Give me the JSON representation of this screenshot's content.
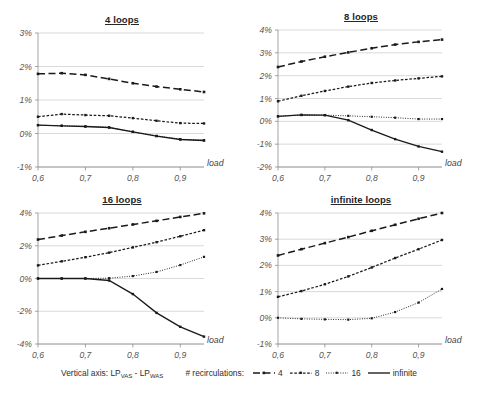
{
  "figure": {
    "width": 478,
    "height": 404,
    "background": "#ffffff",
    "ink": "#1a1a1a",
    "grid_color": "#c9c9c9"
  },
  "legend": {
    "vertical_axis_prefix": "Vertical axis: LP",
    "vertical_axis_sub1": "VAS",
    "vertical_axis_middle": " - LP",
    "vertical_axis_sub2": "WAS",
    "vertical_axis_full": "Vertical axis: LPVAS - LPWAS",
    "recirculations_caption": "# recirculations:",
    "items": [
      {
        "label": "4",
        "style": "long-dash"
      },
      {
        "label": "8",
        "style": "short-dash"
      },
      {
        "label": "16",
        "style": "dotted"
      },
      {
        "label": "infinite",
        "style": "solid"
      }
    ]
  },
  "chart_data": [
    {
      "type": "line",
      "title": "4 loops",
      "xlabel": "load",
      "ylabel": "",
      "xlim": [
        0.6,
        0.95
      ],
      "ylim": [
        -1,
        3
      ],
      "yticks": [
        3,
        2,
        1,
        0,
        -1
      ],
      "ytick_labels": [
        "3%",
        "2%",
        "1%",
        "0%",
        "-1%"
      ],
      "xticks": [
        0.6,
        0.7,
        0.8,
        0.9
      ],
      "xtick_labels": [
        "0,6",
        "0,7",
        "0,8",
        "0,9"
      ],
      "grid": true,
      "legend_position": "external-bottom",
      "x": [
        0.6,
        0.65,
        0.7,
        0.75,
        0.8,
        0.85,
        0.9,
        0.95
      ],
      "series": [
        {
          "name": "4",
          "values": [
            1.78,
            1.8,
            1.75,
            1.63,
            1.5,
            1.4,
            1.32,
            1.24
          ]
        },
        {
          "name": "8",
          "values": [
            0.5,
            0.58,
            0.55,
            0.53,
            0.46,
            0.38,
            0.31,
            0.3
          ]
        },
        {
          "name": "16",
          "values": [
            0.25,
            0.23,
            0.21,
            0.18,
            0.05,
            -0.07,
            -0.17,
            -0.2
          ]
        },
        {
          "name": "infinite",
          "values": [
            0.25,
            0.23,
            0.21,
            0.18,
            0.05,
            -0.08,
            -0.18,
            -0.21
          ]
        }
      ]
    },
    {
      "type": "line",
      "title": "8 loops",
      "xlabel": "load",
      "ylabel": "",
      "xlim": [
        0.6,
        0.95
      ],
      "ylim": [
        -2,
        4
      ],
      "yticks": [
        4,
        3,
        2,
        1,
        0,
        -1,
        -2
      ],
      "ytick_labels": [
        "4%",
        "3%",
        "2%",
        "1%",
        "0%",
        "-1%",
        "-2%"
      ],
      "xticks": [
        0.6,
        0.7,
        0.8,
        0.9
      ],
      "xtick_labels": [
        "0,6",
        "0,7",
        "0,8",
        "0,9"
      ],
      "grid": true,
      "legend_position": "external-bottom",
      "x": [
        0.6,
        0.65,
        0.7,
        0.75,
        0.8,
        0.85,
        0.9,
        0.95
      ],
      "series": [
        {
          "name": "4",
          "values": [
            2.38,
            2.62,
            2.83,
            3.02,
            3.2,
            3.36,
            3.48,
            3.58
          ]
        },
        {
          "name": "8",
          "values": [
            0.88,
            1.12,
            1.33,
            1.52,
            1.68,
            1.79,
            1.88,
            1.97
          ]
        },
        {
          "name": "16",
          "values": [
            0.22,
            0.28,
            0.27,
            0.24,
            0.2,
            0.16,
            0.1,
            0.1
          ]
        },
        {
          "name": "infinite",
          "values": [
            0.22,
            0.28,
            0.27,
            0.05,
            -0.38,
            -0.78,
            -1.1,
            -1.33
          ]
        }
      ]
    },
    {
      "type": "line",
      "title": "16 loops",
      "xlabel": "load",
      "ylabel": "",
      "xlim": [
        0.6,
        0.95
      ],
      "ylim": [
        -4,
        4
      ],
      "yticks": [
        4,
        2,
        0,
        -2,
        -4
      ],
      "ytick_labels": [
        "4%",
        "2%",
        "0%",
        "-2%",
        "-4%"
      ],
      "xticks": [
        0.6,
        0.7,
        0.8,
        0.9
      ],
      "xtick_labels": [
        "0,6",
        "0,7",
        "0,8",
        "0,9"
      ],
      "grid": true,
      "legend_position": "external-bottom",
      "x": [
        0.6,
        0.65,
        0.7,
        0.75,
        0.8,
        0.85,
        0.9,
        0.95
      ],
      "series": [
        {
          "name": "4",
          "values": [
            2.38,
            2.62,
            2.85,
            3.07,
            3.3,
            3.52,
            3.76,
            3.98
          ]
        },
        {
          "name": "8",
          "values": [
            0.8,
            1.05,
            1.3,
            1.58,
            1.9,
            2.22,
            2.58,
            2.95
          ]
        },
        {
          "name": "16",
          "values": [
            0.0,
            0.0,
            0.0,
            0.02,
            0.15,
            0.4,
            0.82,
            1.32
          ]
        },
        {
          "name": "infinite",
          "values": [
            0.0,
            0.0,
            0.0,
            -0.12,
            -0.95,
            -2.1,
            -2.95,
            -3.55
          ]
        }
      ]
    },
    {
      "type": "line",
      "title": "infinite loops",
      "xlabel": "load",
      "ylabel": "",
      "xlim": [
        0.6,
        0.95
      ],
      "ylim": [
        -1,
        4
      ],
      "yticks": [
        4,
        3,
        2,
        1,
        0,
        -1
      ],
      "ytick_labels": [
        "4%",
        "3%",
        "2%",
        "1%",
        "0%",
        "-1%"
      ],
      "xticks": [
        0.6,
        0.7,
        0.8,
        0.9
      ],
      "xtick_labels": [
        "0,6",
        "0,7",
        "0,8",
        "0,9"
      ],
      "grid": true,
      "legend_position": "external-bottom",
      "x": [
        0.6,
        0.65,
        0.7,
        0.75,
        0.8,
        0.85,
        0.9,
        0.95
      ],
      "series": [
        {
          "name": "4",
          "values": [
            2.38,
            2.62,
            2.85,
            3.08,
            3.32,
            3.55,
            3.78,
            4.0
          ]
        },
        {
          "name": "8",
          "values": [
            0.8,
            1.02,
            1.28,
            1.58,
            1.92,
            2.28,
            2.62,
            2.97
          ]
        },
        {
          "name": "16",
          "values": [
            0.0,
            -0.04,
            -0.06,
            -0.07,
            -0.02,
            0.22,
            0.58,
            1.1
          ]
        },
        {
          "name": "infinite",
          "values": [
            null,
            null,
            null,
            null,
            null,
            null,
            null,
            null
          ]
        }
      ]
    }
  ]
}
